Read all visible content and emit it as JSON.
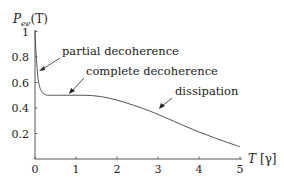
{
  "chart_data": {
    "type": "line",
    "title": "",
    "ylabel": "P_ee(T)",
    "ylabel_display": {
      "main": "P",
      "sub": "ee",
      "arg": "(T)"
    },
    "xlabel": "T [γ]",
    "xlabel_display": {
      "var": "T",
      "unit": "[γ]"
    },
    "xlim": [
      0,
      5
    ],
    "ylim": [
      0,
      1
    ],
    "grid": false,
    "legend": null,
    "x_ticks": [
      "0",
      "1",
      "2",
      "3",
      "4",
      "5"
    ],
    "y_ticks": [
      "0.2",
      "0.4",
      "0.6",
      "0.8",
      "1"
    ],
    "series": [
      {
        "name": "P_ee(T)",
        "x": [
          0.0,
          0.02,
          0.05,
          0.08,
          0.12,
          0.16,
          0.2,
          0.25,
          0.3,
          0.4,
          0.6,
          0.8,
          1.0,
          1.2,
          1.4,
          1.6,
          1.8,
          2.0,
          2.2,
          2.4,
          2.6,
          2.8,
          3.0,
          3.2,
          3.4,
          3.6,
          3.8,
          4.0,
          4.2,
          4.4,
          4.6,
          4.8,
          5.0
        ],
        "values": [
          1.0,
          0.86,
          0.72,
          0.62,
          0.56,
          0.53,
          0.515,
          0.505,
          0.5,
          0.5,
          0.5,
          0.5,
          0.5,
          0.5,
          0.497,
          0.49,
          0.478,
          0.462,
          0.443,
          0.422,
          0.4,
          0.376,
          0.35,
          0.322,
          0.294,
          0.266,
          0.238,
          0.212,
          0.188,
          0.163,
          0.14,
          0.118,
          0.095
        ]
      }
    ],
    "annotations": [
      {
        "text": "partial decoherence",
        "arrow_to": {
          "x": 0.05,
          "y": 0.72
        }
      },
      {
        "text": "complete decoherence",
        "arrow_to": {
          "x": 0.85,
          "y": 0.5
        }
      },
      {
        "text": "dissipation",
        "arrow_to": {
          "x": 2.55,
          "y": 0.41
        }
      }
    ]
  }
}
